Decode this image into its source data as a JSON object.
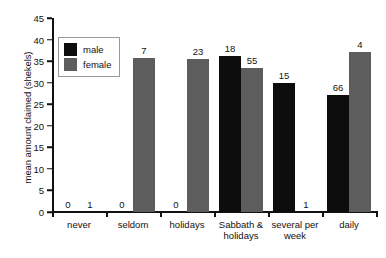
{
  "chart_data": {
    "type": "bar",
    "title": "",
    "xlabel": "",
    "ylabel": "mean amount claimed (shekels)",
    "ylim": [
      0,
      45
    ],
    "ytick_step": 5,
    "ytick_labels": [
      "0",
      "5",
      "10",
      "15",
      "20",
      "25",
      "30",
      "35",
      "40",
      "45"
    ],
    "grid": false,
    "legend_position": "upper-left-inside",
    "categories": [
      "never",
      "seldom",
      "holidays",
      "Sabbath & holidays",
      "several per week",
      "daily"
    ],
    "series": [
      {
        "name": "male",
        "color": "#0d0d0d",
        "values": [
          0,
          0,
          0,
          36.2,
          30.0,
          27.1
        ],
        "point_labels": [
          "0",
          "0",
          "0",
          "18",
          "15",
          "66"
        ]
      },
      {
        "name": "female",
        "color": "#5d5d5d",
        "values": [
          0,
          35.7,
          35.5,
          33.4,
          0,
          37.1
        ],
        "point_labels": [
          "1",
          "7",
          "23",
          "55",
          "1",
          "4"
        ]
      }
    ]
  },
  "legend": {
    "entries": [
      {
        "label": "male",
        "color": "#0d0d0d"
      },
      {
        "label": "female",
        "color": "#5d5d5d"
      }
    ]
  }
}
